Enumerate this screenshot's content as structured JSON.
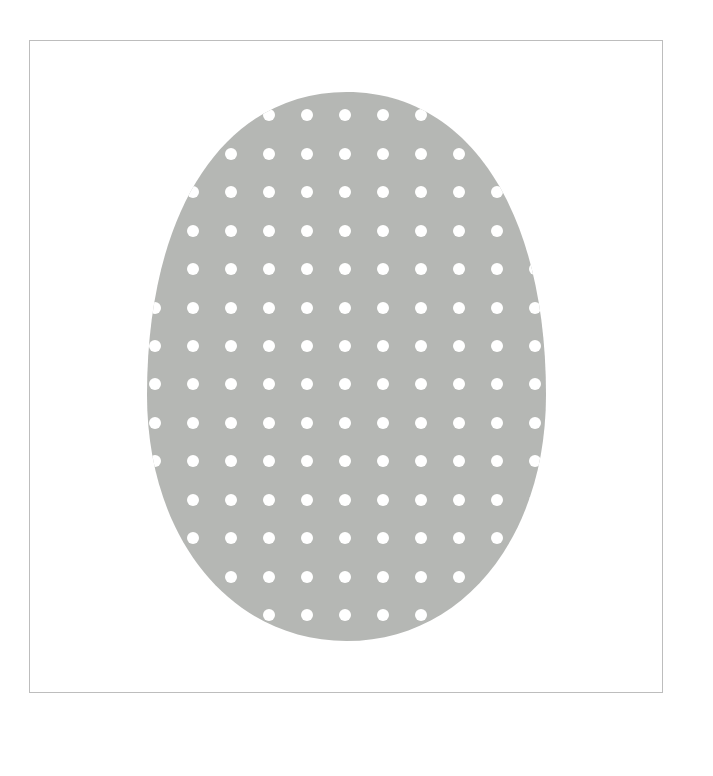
{
  "image": {
    "subject": "polka-dot egg",
    "background_color": "#ffffff",
    "frame": {
      "border_color": "#bdbdbd"
    },
    "egg": {
      "fill_color": "#b5b7b4",
      "center_x": 346.5,
      "top_y": 92,
      "bottom_y": 641,
      "left_x": 147,
      "right_x": 546
    },
    "dots": {
      "color": "#ffffff",
      "radius": 6,
      "columns_x": [
        155,
        193,
        231,
        269,
        307,
        345,
        383,
        421,
        459,
        497,
        535
      ],
      "rows_y": [
        115,
        154,
        192,
        231,
        269,
        308,
        346,
        384,
        423,
        461,
        500,
        538,
        577,
        615
      ]
    }
  }
}
